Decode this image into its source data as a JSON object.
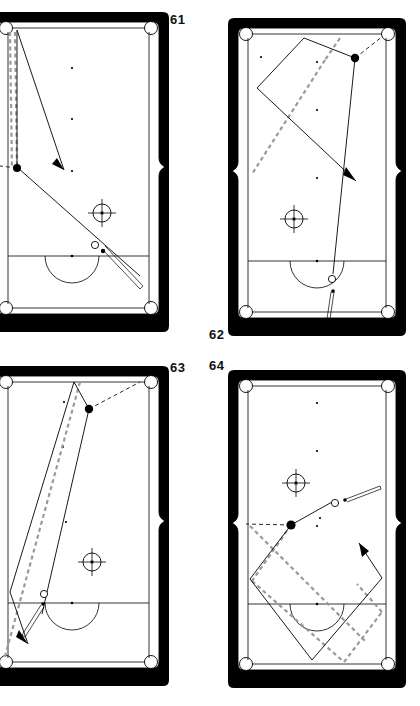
{
  "page": {
    "background": "#ffffff",
    "width": 420,
    "height": 706
  },
  "colors": {
    "rail": "#000000",
    "cloth": "#ffffff",
    "solid_path": "#000000",
    "ghost_path": "#9a9a9a",
    "label": "#111111"
  },
  "labels": {
    "d61": "61",
    "d62": "62",
    "d63": "63",
    "d64": "64"
  },
  "diagrams": [
    {
      "id": "d61",
      "number": "61",
      "number_position": "top-right",
      "description": "Cue ball near head string struck up-table; object ball at left side pocket area with two vertical ghost lines tracing the long rail and a solid angled shot line with arrow pointing down-right into mid table.",
      "elements": {
        "cue_ball": "open circle on shot line right of center",
        "object_ball": "filled dot at left rail near side pocket",
        "ghost_lines": 2,
        "arrows": 1,
        "crosshair_targets": 1,
        "cue_stick": "lower right, aiming up-left"
      }
    },
    {
      "id": "d62",
      "number": "62",
      "number_position": "bottom-left",
      "description": "Cue ball on the head string below the D, shot travels up table to an object ball on the upper right; kicked path bounces off upper rail and left rail, with ghost dashed line and an arrow pointing down-right.",
      "elements": {
        "cue_ball": "open circle on the D arc near foot",
        "object_ball": "filled dot upper right",
        "ghost_lines": 1,
        "arrows": 1,
        "crosshair_targets": 1,
        "cue_stick": "bottom center, vertical"
      }
    },
    {
      "id": "d63",
      "number": "63",
      "number_position": "top-right",
      "description": "Long diagonal bank: cue ball below the head string, solid line runs up to the top rail and back down-left, ghost dashed line parallel, arrow exits lower left; object ball near upper right with dashed black aim line to the corner pocket.",
      "elements": {
        "cue_ball": "open circle just above head string, left of center",
        "object_ball": "filled dot upper right area",
        "ghost_lines": 1,
        "arrows": 1,
        "crosshair_targets": 1,
        "cue_stick": "lower left, angled"
      }
    },
    {
      "id": "d64",
      "number": "64",
      "number_position": "top-left",
      "description": "Multi-rail diamond pattern in the lower half: solid path and grey ghost path form overlapping diamonds bouncing between the side rails and the foot rail; object ball at left side pocket with black dashed aim line; arrow points up-right.",
      "elements": {
        "cue_ball": "open circle upper middle right on the cue line",
        "object_ball": "filled dot at left side pocket",
        "ghost_lines": 4,
        "arrows": 1,
        "crosshair_targets": 1,
        "cue_stick": "upper right, aiming left"
      }
    }
  ]
}
